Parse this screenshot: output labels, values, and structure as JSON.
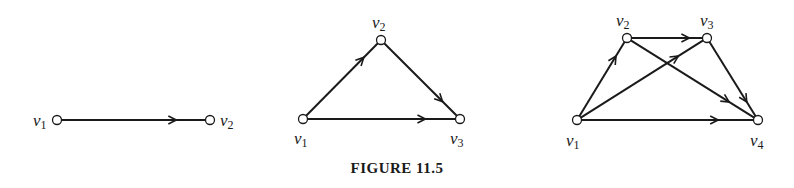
{
  "caption": "FIGURE 11.5",
  "colors": {
    "ink": "#1a1a1a",
    "background": "#ffffff"
  },
  "graphs": [
    {
      "id": "graph-1",
      "nodes": [
        {
          "id": "v1",
          "label": "v",
          "sub": "1",
          "x": 57,
          "y": 120,
          "lx": 33,
          "ly": 126
        },
        {
          "id": "v2",
          "label": "v",
          "sub": "2",
          "x": 210,
          "y": 120,
          "lx": 220,
          "ly": 126
        }
      ],
      "edges": [
        {
          "from": "v1",
          "to": "v2"
        }
      ]
    },
    {
      "id": "graph-2",
      "nodes": [
        {
          "id": "v1",
          "label": "v",
          "sub": "1",
          "x": 303,
          "y": 119,
          "lx": 294,
          "ly": 144
        },
        {
          "id": "v2",
          "label": "v",
          "sub": "2",
          "x": 381,
          "y": 40,
          "lx": 372,
          "ly": 28
        },
        {
          "id": "v3",
          "label": "v",
          "sub": "3",
          "x": 460,
          "y": 119,
          "lx": 450,
          "ly": 144
        }
      ],
      "edges": [
        {
          "from": "v1",
          "to": "v2"
        },
        {
          "from": "v2",
          "to": "v3"
        },
        {
          "from": "v1",
          "to": "v3"
        }
      ]
    },
    {
      "id": "graph-3",
      "nodes": [
        {
          "id": "v1",
          "label": "v",
          "sub": "1",
          "x": 577,
          "y": 120,
          "lx": 566,
          "ly": 146
        },
        {
          "id": "v2",
          "label": "v",
          "sub": "2",
          "x": 627,
          "y": 38,
          "lx": 616,
          "ly": 26
        },
        {
          "id": "v3",
          "label": "v",
          "sub": "3",
          "x": 707,
          "y": 38,
          "lx": 700,
          "ly": 26
        },
        {
          "id": "v4",
          "label": "v",
          "sub": "4",
          "x": 758,
          "y": 120,
          "lx": 750,
          "ly": 146
        }
      ],
      "edges": [
        {
          "from": "v1",
          "to": "v2"
        },
        {
          "from": "v1",
          "to": "v3"
        },
        {
          "from": "v1",
          "to": "v4"
        },
        {
          "from": "v2",
          "to": "v3"
        },
        {
          "from": "v2",
          "to": "v4"
        },
        {
          "from": "v3",
          "to": "v4"
        }
      ]
    }
  ]
}
